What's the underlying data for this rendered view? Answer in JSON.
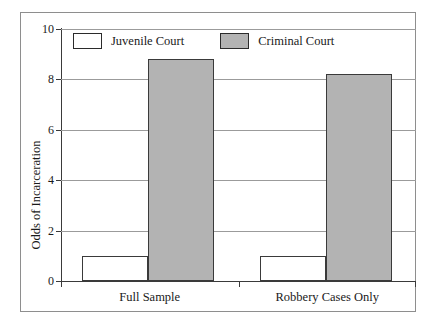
{
  "chart_data": {
    "type": "bar",
    "title": "",
    "xlabel": "",
    "ylabel": "Odds of Incarceration",
    "categories": [
      "Full Sample",
      "Robbery Cases Only"
    ],
    "series": [
      {
        "name": "Juvenile Court",
        "color": "#ffffff",
        "values": [
          1.0,
          1.0
        ]
      },
      {
        "name": "Criminal Court",
        "color": "#b3b3b3",
        "values": [
          8.8,
          8.2
        ]
      }
    ],
    "ylim": [
      0,
      10
    ],
    "yticks": [
      0,
      2,
      4,
      6,
      8,
      10
    ],
    "ytick_labels": [
      "0",
      "2",
      "4",
      "6",
      "8",
      "10"
    ],
    "grid": true,
    "grid_axis": "y",
    "legend_position": "top-left-inside",
    "bar_border_color": "#3a3a3a"
  },
  "legend": {
    "entries": [
      {
        "label": "Juvenile Court",
        "swatch": "juvenile"
      },
      {
        "label": "Criminal Court",
        "swatch": "criminal"
      }
    ]
  },
  "axes": {
    "y_title": "Odds of Incarceration",
    "y_labels": [
      "10",
      "8",
      "6",
      "4",
      "2",
      "0"
    ],
    "x_labels": [
      "Full Sample",
      "Robbery Cases Only"
    ]
  }
}
